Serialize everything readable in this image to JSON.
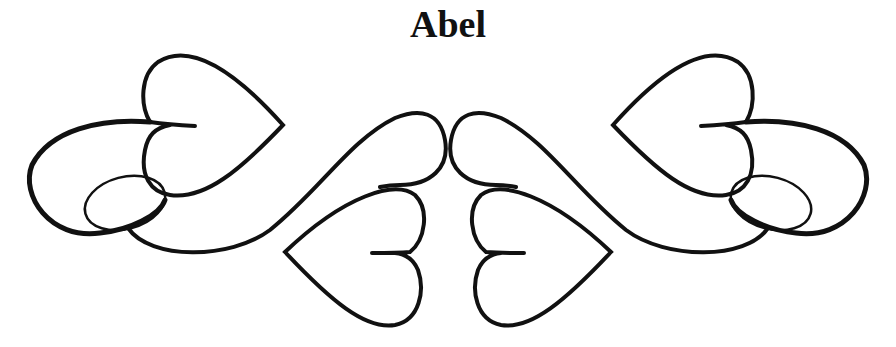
{
  "title": "Abel",
  "ornament": {
    "description": "Symmetrical calligraphic flourish of interlocking hearts",
    "stroke_color": "#111111",
    "background_color": "#ffffff",
    "elements": [
      "upper-left-heart",
      "lower-left-heart",
      "upper-right-heart",
      "lower-right-heart",
      "left-loop",
      "right-loop",
      "center-s-scrolls"
    ]
  }
}
